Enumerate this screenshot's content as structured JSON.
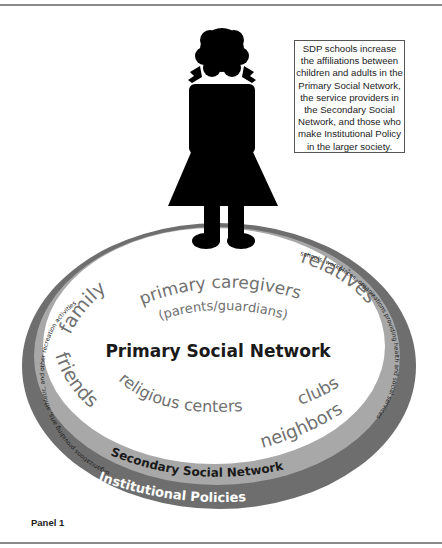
{
  "callout": {
    "text": "SDP schools increase the affiliations between children and adults in the Primary Social Network, the service providers in the Secondary Social Network, and those who make Institutional Policy in the larger society."
  },
  "panel_label": "Panel 1",
  "primary_network": {
    "title": "Primary Social Network",
    "caregivers": "primary caregivers",
    "caregivers_sub": "(parents/guardians)",
    "family": "family",
    "relatives": "relatives",
    "friends": "friends",
    "religious_centers": "religious centers",
    "clubs": "clubs",
    "neighbors": "neighbors"
  },
  "secondary_network": {
    "title": "Secondary Social Network",
    "left_arc": "organizations providing arts, athletic, and other recreation activities",
    "right_arc": "schools, workplaces, organizations providing health and social services"
  },
  "institutional": {
    "title": "Institutional Policies"
  },
  "colors": {
    "outer_band": "#6e6e6e",
    "middle_band": "#a8a8a8",
    "inner_fill": "#ffffff",
    "figure": "#000000",
    "secondary_text": "#707070"
  }
}
